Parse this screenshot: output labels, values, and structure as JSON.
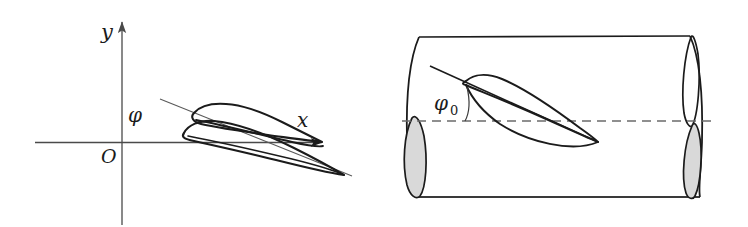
{
  "figure": {
    "background_color": "#ffffff",
    "stroke_color": "#1b1b1b",
    "thin_stroke_color": "#5a5a5a",
    "fill_gray": "#d9d9d9",
    "panels": [
      {
        "id": "left-panel",
        "description": "Airfoil profile in an x-y coordinate system rotated by angle phi",
        "axes": {
          "y_axis_label": "y",
          "x_axis_label": "x",
          "origin_label": "O"
        },
        "angle_label": "φ"
      },
      {
        "id": "right-panel",
        "description": "Airfoil section inside a cylindrical stream tube set at angle phi-zero to the cylinder axis",
        "angle_label": "φ",
        "angle_subscript": "0",
        "centerline_style": "dashed"
      }
    ]
  }
}
